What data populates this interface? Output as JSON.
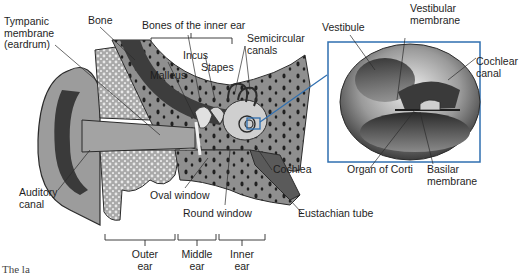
{
  "diagram": {
    "colors": {
      "bone_light": "#c9c9c9",
      "bone_dark": "#4a4a4a",
      "tissue_mid": "#8c8c8c",
      "outline": "#2b2b2b",
      "highlight_box": "#2f6fb0",
      "background": "#ffffff"
    },
    "labels": {
      "tympanic_membrane": [
        "Tympanic",
        "membrane",
        "(eardrum)"
      ],
      "bone": "Bone",
      "bones_inner_ear": "Bones of the inner ear",
      "incus": "Incus",
      "stapes": "Stapes",
      "malleus": "Malleus",
      "semicircular_canals": [
        "Semicircular",
        "canals"
      ],
      "cochlea": "Cochlea",
      "oval_window": "Oval window",
      "round_window": "Round window",
      "eustachian_tube": "Eustachian tube",
      "auditory_canal": [
        "Auditory",
        "canal"
      ],
      "outer_ear": [
        "Outer",
        "ear"
      ],
      "middle_ear": [
        "Middle",
        "ear"
      ],
      "inner_ear": [
        "Inner",
        "ear"
      ]
    },
    "inset": {
      "vestibule": "Vestibule",
      "vestibular_membrane": [
        "Vestibular",
        "membrane"
      ],
      "cochlear_canal": [
        "Cochlear",
        "canal"
      ],
      "organ_of_corti": "Organ of Corti",
      "basilar_membrane": [
        "Basilar",
        "membrane"
      ]
    },
    "caption_partial": "The la"
  }
}
